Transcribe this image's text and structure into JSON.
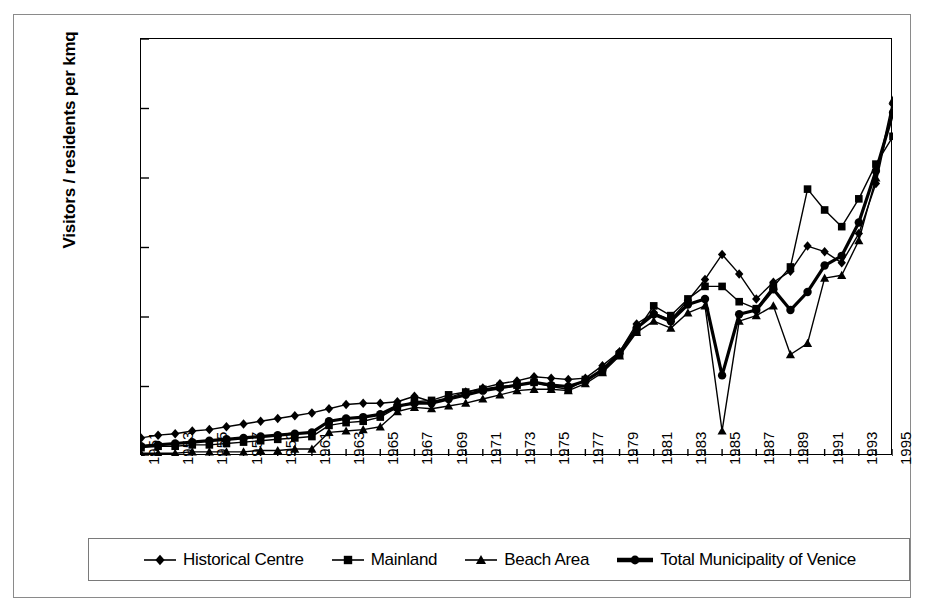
{
  "chart_data": {
    "type": "line",
    "title": "",
    "xlabel": "",
    "ylabel": "Visitors / residents per kmq",
    "xlim": [
      1951,
      1995
    ],
    "ylim": [
      0,
      300
    ],
    "ytick_step": 50,
    "ytick_labels": [
      "300,00",
      "250,00",
      "200,00",
      "150,00",
      "100,00",
      "50,00",
      "0,00"
    ],
    "ytick_values": [
      300,
      250,
      200,
      150,
      100,
      50,
      0
    ],
    "grid": false,
    "legend_position": "bottom",
    "decimal_separator": ",",
    "x": [
      1951,
      1952,
      1953,
      1954,
      1955,
      1956,
      1957,
      1958,
      1959,
      1960,
      1961,
      1962,
      1963,
      1964,
      1965,
      1966,
      1967,
      1968,
      1969,
      1970,
      1971,
      1972,
      1973,
      1974,
      1975,
      1976,
      1977,
      1978,
      1979,
      1980,
      1981,
      1982,
      1983,
      1984,
      1985,
      1986,
      1987,
      1988,
      1989,
      1990,
      1991,
      1992,
      1993,
      1994,
      1995
    ],
    "xtick_labels": [
      "1951",
      "1953",
      "1955",
      "1957",
      "1959",
      "1961",
      "1963",
      "1965",
      "1967",
      "1969",
      "1971",
      "1973",
      "1975",
      "1977",
      "1979",
      "1981",
      "1983",
      "1985",
      "1987",
      "1989",
      "1991",
      "1993",
      "1995"
    ],
    "xtick_values": [
      1951,
      1953,
      1955,
      1957,
      1959,
      1961,
      1963,
      1965,
      1967,
      1969,
      1971,
      1973,
      1975,
      1977,
      1979,
      1981,
      1983,
      1985,
      1987,
      1989,
      1991,
      1993,
      1995
    ],
    "series": [
      {
        "name": "Historical Centre",
        "marker": "diamond",
        "linewidth": 1.4,
        "values": [
          13,
          15,
          16,
          18,
          19,
          21,
          23,
          25,
          27,
          29,
          31,
          34,
          37,
          38,
          38,
          39,
          43,
          39,
          42,
          46,
          49,
          52,
          54,
          57,
          56,
          55,
          56,
          65,
          75,
          95,
          103,
          98,
          112,
          127,
          145,
          131,
          113,
          125,
          133,
          151,
          147,
          139,
          160,
          196,
          253
        ]
      },
      {
        "name": "Mainland",
        "marker": "square",
        "linewidth": 1.4,
        "values": [
          6,
          7,
          7,
          8,
          8,
          9,
          10,
          11,
          12,
          13,
          14,
          22,
          24,
          25,
          28,
          35,
          39,
          40,
          44,
          46,
          48,
          50,
          51,
          53,
          50,
          48,
          55,
          61,
          73,
          90,
          108,
          101,
          113,
          122,
          122,
          111,
          106,
          122,
          136,
          192,
          177,
          165,
          185,
          210,
          230
        ]
      },
      {
        "name": "Beach Area",
        "marker": "triangle",
        "linewidth": 1.4,
        "values": [
          2,
          2,
          2,
          3,
          3,
          3,
          3,
          4,
          4,
          5,
          5,
          17,
          18,
          19,
          21,
          32,
          35,
          34,
          36,
          38,
          41,
          44,
          47,
          48,
          48,
          47,
          52,
          60,
          72,
          89,
          97,
          92,
          103,
          108,
          18,
          97,
          101,
          108,
          73,
          81,
          128,
          130,
          155,
          200,
          256
        ]
      },
      {
        "name": "Total Municipality of Venice",
        "marker": "circle",
        "linewidth": 3.2,
        "values": [
          7,
          8,
          9,
          10,
          11,
          12,
          13,
          14,
          15,
          16,
          17,
          25,
          27,
          28,
          30,
          36,
          38,
          38,
          41,
          44,
          47,
          49,
          51,
          53,
          51,
          50,
          54,
          62,
          74,
          92,
          102,
          97,
          109,
          113,
          58,
          102,
          105,
          120,
          105,
          118,
          137,
          144,
          168,
          205,
          247
        ]
      }
    ]
  },
  "legend": {
    "entries": [
      {
        "label": "Historical Centre",
        "marker": "diamond-marker-icon"
      },
      {
        "label": "Mainland",
        "marker": "square-marker-icon"
      },
      {
        "label": "Beach Area",
        "marker": "triangle-marker-icon"
      },
      {
        "label": "Total Municipality of Venice",
        "marker": "circle-marker-icon"
      }
    ]
  },
  "colors": {
    "series": "#000000",
    "axis": "#000000",
    "frame": "#8a8a8a",
    "background": "#ffffff"
  }
}
